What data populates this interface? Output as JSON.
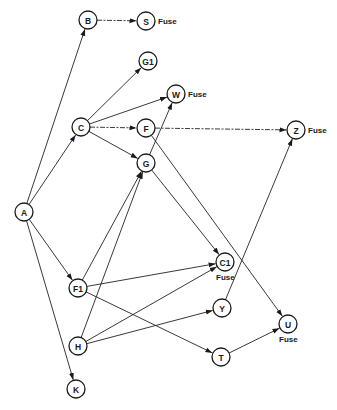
{
  "diagram": {
    "title": "",
    "nodes": [
      {
        "id": "A",
        "label": "A",
        "x": 24,
        "y": 212
      },
      {
        "id": "B",
        "label": "B",
        "x": 88,
        "y": 20
      },
      {
        "id": "S",
        "label": "S",
        "x": 146,
        "y": 21,
        "note": "Fuse",
        "note_pos": "right"
      },
      {
        "id": "G1",
        "label": "G1",
        "x": 148,
        "y": 61
      },
      {
        "id": "W",
        "label": "W",
        "x": 176,
        "y": 94,
        "note": "Fuse",
        "note_pos": "right"
      },
      {
        "id": "C",
        "label": "C",
        "x": 81,
        "y": 127
      },
      {
        "id": "F",
        "label": "F",
        "x": 146,
        "y": 128
      },
      {
        "id": "Z",
        "label": "Z",
        "x": 296,
        "y": 130,
        "note": "Fuse",
        "note_pos": "right"
      },
      {
        "id": "G",
        "label": "G",
        "x": 146,
        "y": 163
      },
      {
        "id": "C1",
        "label": "C1",
        "x": 225,
        "y": 262,
        "note": "Fuse",
        "note_pos": "below"
      },
      {
        "id": "F1",
        "label": "F1",
        "x": 78,
        "y": 288
      },
      {
        "id": "Y",
        "label": "Y",
        "x": 222,
        "y": 308
      },
      {
        "id": "U",
        "label": "U",
        "x": 288,
        "y": 324,
        "note": "Fuse",
        "note_pos": "below"
      },
      {
        "id": "H",
        "label": "H",
        "x": 78,
        "y": 346
      },
      {
        "id": "T",
        "label": "T",
        "x": 221,
        "y": 357
      },
      {
        "id": "K",
        "label": "K",
        "x": 76,
        "y": 389
      }
    ],
    "edges": [
      {
        "from": "A",
        "to": "B",
        "style": "solid"
      },
      {
        "from": "A",
        "to": "C",
        "style": "solid"
      },
      {
        "from": "A",
        "to": "F1",
        "style": "solid"
      },
      {
        "from": "A",
        "to": "K",
        "style": "solid"
      },
      {
        "from": "B",
        "to": "S",
        "style": "dashed"
      },
      {
        "from": "C",
        "to": "G1",
        "style": "solid"
      },
      {
        "from": "C",
        "to": "W",
        "style": "solid"
      },
      {
        "from": "C",
        "to": "F",
        "style": "dashed"
      },
      {
        "from": "C",
        "to": "G",
        "style": "solid"
      },
      {
        "from": "F",
        "to": "Z",
        "style": "dashed"
      },
      {
        "from": "F",
        "to": "U",
        "style": "solid"
      },
      {
        "from": "G",
        "to": "W",
        "style": "solid"
      },
      {
        "from": "G",
        "to": "C1",
        "style": "solid"
      },
      {
        "from": "F1",
        "to": "G",
        "style": "solid"
      },
      {
        "from": "F1",
        "to": "C1",
        "style": "solid"
      },
      {
        "from": "F1",
        "to": "T",
        "style": "solid"
      },
      {
        "from": "H",
        "to": "G",
        "style": "solid"
      },
      {
        "from": "H",
        "to": "C1",
        "style": "solid"
      },
      {
        "from": "H",
        "to": "Y",
        "style": "solid"
      },
      {
        "from": "Y",
        "to": "Z",
        "style": "solid"
      },
      {
        "from": "T",
        "to": "U",
        "style": "solid"
      }
    ],
    "node_radius": 9,
    "colors": {
      "stroke": "#1a1a1a",
      "background": "#ffffff"
    }
  }
}
